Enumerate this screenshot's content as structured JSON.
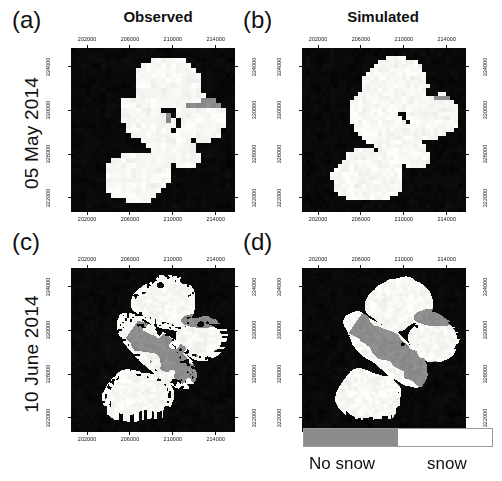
{
  "figure": {
    "columns": [
      {
        "id": "observed",
        "label": "Observed"
      },
      {
        "id": "simulated",
        "label": "Simulated"
      }
    ],
    "rows": [
      {
        "id": "may",
        "label": "05 May 2014"
      },
      {
        "id": "june",
        "label": "10 June 2014"
      }
    ],
    "panels": [
      {
        "id": "a",
        "letter": "(a)",
        "column": "Observed",
        "row": "05 May 2014"
      },
      {
        "id": "b",
        "letter": "(b)",
        "column": "Simulated",
        "row": "05 May 2014"
      },
      {
        "id": "c",
        "letter": "(c)",
        "column": "Observed",
        "row": "10 June 2014"
      },
      {
        "id": "d",
        "letter": "(d)",
        "column": "Simulated",
        "row": "10 June 2014"
      }
    ],
    "axes": {
      "x_ticks": [
        "202000",
        "206000",
        "210000",
        "214000"
      ],
      "y_ticks": [
        "334000",
        "330000",
        "326000",
        "322000"
      ],
      "x_range": [
        200500,
        215800
      ],
      "y_range": [
        320700,
        335700
      ]
    },
    "legend": {
      "no_snow_label": "No snow",
      "snow_label": "snow",
      "no_snow_color": "#8c8c8c",
      "snow_color": "#ffffff",
      "border_color": "#9a9a9a"
    },
    "colors": {
      "background": "#ffffff",
      "nodata": "#000000",
      "snow": "#f7f7f4",
      "no_snow": "#8c8c8c",
      "text": "#111111"
    }
  },
  "chart_data": {
    "type": "heatmap",
    "title": "",
    "subtitle": "",
    "xlabel": "",
    "ylabel": "",
    "grid": false,
    "legend_position": "bottom-right",
    "categories": [
      "No snow",
      "snow"
    ],
    "series": [
      {
        "name": "(a) Observed 05 May 2014",
        "snow_fraction_percent": 96,
        "no_snow_fraction_percent": 4,
        "description": "Near-complete snow cover over catchment; small grey no-snow patches along the north-eastern valley arm and a few isolated pixels near the centre."
      },
      {
        "name": "(b) Simulated 05 May 2014",
        "snow_fraction_percent": 99,
        "no_snow_fraction_percent": 1,
        "description": "Almost fully snow covered; a single thin grey no-snow strip on the eastern edge."
      },
      {
        "name": "(c) Observed 10 June 2014",
        "snow_fraction_percent": 78,
        "no_snow_fraction_percent": 22,
        "description": "Patchy snow with ragged margins; a broad grey no-snow band follows the main valley from east to the centre, plus several black data gaps."
      },
      {
        "name": "(d) Simulated 10 June 2014",
        "snow_fraction_percent": 83,
        "no_snow_fraction_percent": 17,
        "description": "Smoother snow field with a continuous grey no-snow tongue along the main valley axis."
      }
    ],
    "axis_x_ticks": [
      202000,
      206000,
      210000,
      214000
    ],
    "axis_y_ticks": [
      322000,
      326000,
      330000,
      334000
    ],
    "xlim": [
      200500,
      215800
    ],
    "ylim": [
      320700,
      335700
    ]
  }
}
